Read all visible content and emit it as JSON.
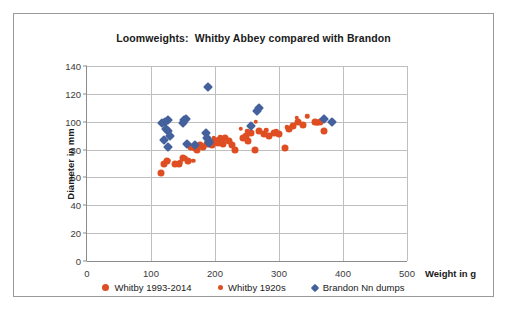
{
  "chart_data": {
    "type": "scatter",
    "title": "Loomweights:  Whitby Abbey compared with Brandon",
    "xlabel": "Weight in g",
    "ylabel": "Diameter in mm",
    "xlim": [
      0,
      500
    ],
    "ylim": [
      0,
      140
    ],
    "xticks": [
      "0",
      "100",
      "200",
      "300",
      "400",
      "500"
    ],
    "yticks": [
      "0",
      "20",
      "40",
      "60",
      "80",
      "100",
      "120",
      "140"
    ],
    "grid": true,
    "legend_position": "bottom",
    "colors": {
      "orange": "#DF4E22",
      "blue": "#44619E",
      "grid": "#BFBFBF",
      "axis": "#8C8C8C",
      "frame": "#9A9A9A",
      "text": "#1A1A1A"
    },
    "series": [
      {
        "name": "Whitby 1993-2014",
        "marker": "circle",
        "color": "#DF4E22",
        "size": 7,
        "points": [
          [
            116,
            63
          ],
          [
            120,
            70
          ],
          [
            125,
            72
          ],
          [
            138,
            70
          ],
          [
            144,
            70
          ],
          [
            150,
            74
          ],
          [
            158,
            72
          ],
          [
            162,
            82
          ],
          [
            168,
            81
          ],
          [
            172,
            80
          ],
          [
            176,
            83
          ],
          [
            182,
            82
          ],
          [
            188,
            84
          ],
          [
            192,
            85
          ],
          [
            196,
            83
          ],
          [
            200,
            86
          ],
          [
            204,
            85
          ],
          [
            206,
            87
          ],
          [
            210,
            86
          ],
          [
            213,
            84
          ],
          [
            216,
            88
          ],
          [
            222,
            86
          ],
          [
            226,
            83
          ],
          [
            232,
            80
          ],
          [
            243,
            88
          ],
          [
            248,
            90
          ],
          [
            252,
            86
          ],
          [
            256,
            92
          ],
          [
            262,
            80
          ],
          [
            268,
            93
          ],
          [
            276,
            91
          ],
          [
            284,
            90
          ],
          [
            292,
            92
          ],
          [
            300,
            91
          ],
          [
            310,
            81
          ],
          [
            316,
            95
          ],
          [
            322,
            97
          ],
          [
            330,
            100
          ],
          [
            338,
            98
          ],
          [
            356,
            100
          ],
          [
            364,
            100
          ],
          [
            370,
            93
          ]
        ]
      },
      {
        "name": "Whitby 1920s",
        "marker": "circle",
        "color": "#DF4E22",
        "size": 4.5,
        "points": [
          [
            128,
            72
          ],
          [
            146,
            71
          ],
          [
            154,
            74
          ],
          [
            166,
            72
          ],
          [
            186,
            84
          ],
          [
            198,
            88
          ],
          [
            208,
            89
          ],
          [
            220,
            87
          ],
          [
            240,
            95
          ],
          [
            250,
            93
          ],
          [
            264,
            100
          ],
          [
            280,
            94
          ],
          [
            296,
            93
          ],
          [
            312,
            96
          ],
          [
            328,
            103
          ],
          [
            344,
            104
          ],
          [
            360,
            99
          ]
        ]
      },
      {
        "name": "Brandon Nn dumps",
        "marker": "diamond",
        "color": "#44619E",
        "size": 7,
        "points": [
          [
            117,
            99
          ],
          [
            122,
            100
          ],
          [
            126,
            101
          ],
          [
            124,
            95
          ],
          [
            127,
            93
          ],
          [
            129,
            90
          ],
          [
            120,
            87
          ],
          [
            127,
            82
          ],
          [
            152,
            101
          ],
          [
            155,
            102
          ],
          [
            150,
            99
          ],
          [
            157,
            84
          ],
          [
            169,
            83
          ],
          [
            189,
            125
          ],
          [
            186,
            92
          ],
          [
            188,
            88
          ],
          [
            190,
            85
          ],
          [
            191,
            86
          ],
          [
            256,
            97
          ],
          [
            266,
            108
          ],
          [
            268,
            110
          ],
          [
            370,
            102
          ],
          [
            383,
            100
          ]
        ]
      }
    ]
  },
  "legend": {
    "items": [
      {
        "label": "Whitby 1993-2014",
        "marker": "circle",
        "color": "#DF4E22",
        "size": 7
      },
      {
        "label": "Whitby 1920s",
        "marker": "circle",
        "color": "#DF4E22",
        "size": 5.5
      },
      {
        "label": "Brandon Nn dumps",
        "marker": "diamond",
        "color": "#44619E",
        "size": 6
      }
    ]
  }
}
